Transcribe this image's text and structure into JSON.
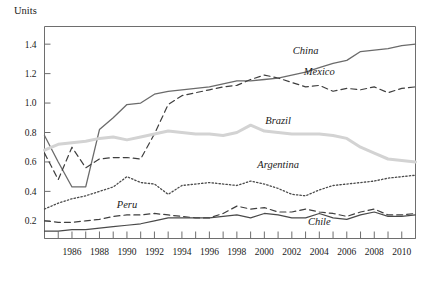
{
  "chart_data": {
    "type": "line",
    "title": "",
    "ylabel": "Units",
    "xlabel": "",
    "ylim": [
      0.08,
      1.52
    ],
    "xlim": [
      1984,
      2011
    ],
    "grid": false,
    "legend_position": "inline-labels",
    "y_ticks": [
      "0.2",
      "0.4",
      "0.6",
      "0.8",
      "1.0",
      "1.2",
      "1.4"
    ],
    "y_tick_values": [
      0.2,
      0.4,
      0.6,
      0.8,
      1.0,
      1.2,
      1.4
    ],
    "x_ticks": [
      "1986",
      "1988",
      "1990",
      "1992",
      "1994",
      "1996",
      "1998",
      "2000",
      "2002",
      "2004",
      "2006",
      "2008",
      "2010"
    ],
    "x_tick_values": [
      1986,
      1988,
      1990,
      1992,
      1994,
      1996,
      1998,
      2000,
      2002,
      2004,
      2006,
      2008,
      2010
    ],
    "x": [
      1984,
      1985,
      1986,
      1987,
      1988,
      1989,
      1990,
      1991,
      1992,
      1993,
      1994,
      1995,
      1996,
      1997,
      1998,
      1999,
      2000,
      2001,
      2002,
      2003,
      2004,
      2005,
      2006,
      2007,
      2008,
      2009,
      2010,
      2011
    ],
    "series": [
      {
        "name": "China",
        "style": "solid",
        "color": "#6b6b6b",
        "width": 1.3,
        "values": [
          0.78,
          0.6,
          0.43,
          0.43,
          0.82,
          0.9,
          0.99,
          1.0,
          1.06,
          1.08,
          1.09,
          1.1,
          1.11,
          1.13,
          1.15,
          1.15,
          1.16,
          1.17,
          1.19,
          1.21,
          1.24,
          1.27,
          1.29,
          1.35,
          1.36,
          1.37,
          1.39,
          1.4
        ],
        "label_x": 2003,
        "label_y": 1.33
      },
      {
        "name": "Mexico",
        "style": "dashed",
        "color": "#3f3f3f",
        "width": 1.2,
        "values": [
          0.66,
          0.48,
          0.7,
          0.56,
          0.62,
          0.63,
          0.63,
          0.62,
          0.79,
          0.99,
          1.05,
          1.07,
          1.09,
          1.11,
          1.12,
          1.16,
          1.19,
          1.17,
          1.14,
          1.11,
          1.12,
          1.08,
          1.1,
          1.09,
          1.11,
          1.07,
          1.1,
          1.11
        ],
        "label_x": 2004,
        "label_y": 1.19
      },
      {
        "name": "Brazil",
        "style": "solid",
        "color": "#d3d3d3",
        "width": 3.0,
        "values": [
          0.68,
          0.72,
          0.73,
          0.74,
          0.76,
          0.77,
          0.75,
          0.77,
          0.79,
          0.81,
          0.8,
          0.79,
          0.79,
          0.78,
          0.8,
          0.85,
          0.81,
          0.8,
          0.79,
          0.79,
          0.79,
          0.78,
          0.76,
          0.7,
          0.66,
          0.62,
          0.61,
          0.6
        ],
        "label_x": 2001,
        "label_y": 0.86
      },
      {
        "name": "Argentina",
        "style": "dotted",
        "color": "#4a4a4a",
        "width": 1.3,
        "values": [
          0.28,
          0.32,
          0.35,
          0.37,
          0.4,
          0.43,
          0.5,
          0.46,
          0.45,
          0.38,
          0.44,
          0.45,
          0.46,
          0.45,
          0.44,
          0.47,
          0.45,
          0.42,
          0.38,
          0.37,
          0.41,
          0.44,
          0.45,
          0.46,
          0.47,
          0.49,
          0.5,
          0.51
        ],
        "label_x": 2001,
        "label_y": 0.56
      },
      {
        "name": "Peru",
        "style": "dashed",
        "color": "#3f3f3f",
        "width": 1.2,
        "values": [
          0.2,
          0.19,
          0.19,
          0.2,
          0.21,
          0.23,
          0.24,
          0.24,
          0.25,
          0.24,
          0.23,
          0.22,
          0.22,
          0.25,
          0.3,
          0.28,
          0.29,
          0.26,
          0.26,
          0.28,
          0.26,
          0.25,
          0.23,
          0.26,
          0.28,
          0.24,
          0.24,
          0.25
        ],
        "label_x": 1990,
        "label_y": 0.29
      },
      {
        "name": "Chile",
        "style": "solid",
        "color": "#4a4a4a",
        "width": 1.2,
        "values": [
          0.13,
          0.13,
          0.14,
          0.14,
          0.15,
          0.16,
          0.17,
          0.18,
          0.2,
          0.22,
          0.22,
          0.22,
          0.22,
          0.23,
          0.24,
          0.22,
          0.25,
          0.24,
          0.22,
          0.22,
          0.25,
          0.22,
          0.21,
          0.24,
          0.26,
          0.23,
          0.23,
          0.24
        ],
        "label_x": 2004,
        "label_y": 0.17
      }
    ]
  }
}
